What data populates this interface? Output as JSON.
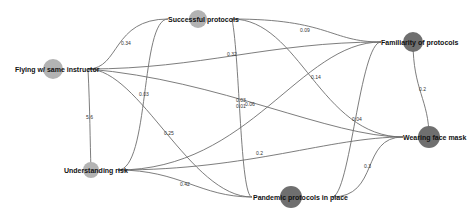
{
  "diagram": {
    "type": "network",
    "colors": {
      "background": "#ffffff",
      "edge": "#6e6e6e",
      "node_light": "#b3b3b3",
      "node_dark": "#6f6f6f",
      "label": "#111111"
    },
    "nodes": [
      {
        "id": "flying",
        "label": "Flying w/ same instructor",
        "cx": 53,
        "cy": 69,
        "r": 10,
        "shade": "light"
      },
      {
        "id": "successful",
        "label": "Successful protocols",
        "cx": 198,
        "cy": 19,
        "r": 9,
        "shade": "light"
      },
      {
        "id": "familiarity",
        "label": "Familiarity of protocols",
        "cx": 413,
        "cy": 42,
        "r": 10,
        "shade": "dark"
      },
      {
        "id": "mask",
        "label": "Wearing face mask",
        "cx": 429,
        "cy": 137,
        "r": 11,
        "shade": "dark"
      },
      {
        "id": "understanding",
        "label": "Understanding risk",
        "cx": 91,
        "cy": 170,
        "r": 8,
        "shade": "light"
      },
      {
        "id": "pandemic",
        "label": "Pandemic protocols in place",
        "cx": 291,
        "cy": 197,
        "r": 11,
        "shade": "dark"
      }
    ],
    "edges": [
      {
        "from": "flying",
        "to": "successful",
        "weight": "0.34"
      },
      {
        "from": "flying",
        "to": "familiarity",
        "weight": "0.32"
      },
      {
        "from": "flying",
        "to": "understanding",
        "weight": "5.6"
      },
      {
        "from": "flying",
        "to": "pandemic",
        "weight": "0.25"
      },
      {
        "from": "flying",
        "to": "mask",
        "weight": "0.03"
      },
      {
        "from": "successful",
        "to": "understanding",
        "weight": "0.03"
      },
      {
        "from": "successful",
        "to": "familiarity",
        "weight": "0.09"
      },
      {
        "from": "successful",
        "to": "mask",
        "weight": "0.14"
      },
      {
        "from": "successful",
        "to": "pandemic",
        "weight": "0.01"
      },
      {
        "from": "understanding",
        "to": "familiarity",
        "weight": "0.06"
      },
      {
        "from": "understanding",
        "to": "mask",
        "weight": "0.2"
      },
      {
        "from": "understanding",
        "to": "pandemic",
        "weight": "0.42"
      },
      {
        "from": "pandemic",
        "to": "familiarity",
        "weight": "0.04"
      },
      {
        "from": "pandemic",
        "to": "mask",
        "weight": "0.3"
      },
      {
        "from": "familiarity",
        "to": "mask",
        "weight": "0.2"
      }
    ]
  }
}
